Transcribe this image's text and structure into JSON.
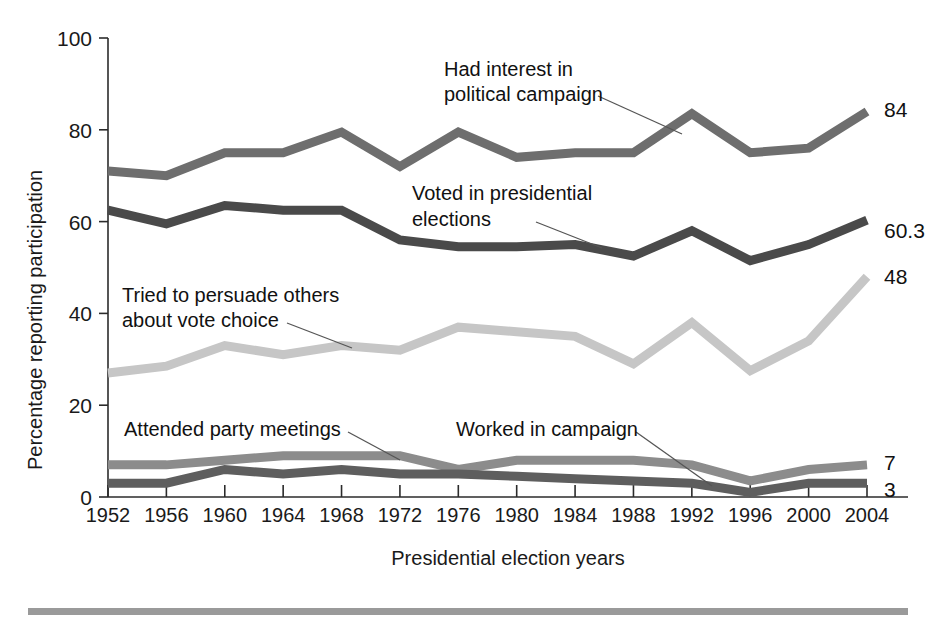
{
  "axes": {
    "ylabel": "Percentage reporting participation",
    "xlabel": "Presidential election years",
    "yticks": [
      "0",
      "20",
      "40",
      "60",
      "80",
      "100"
    ],
    "ylim": [
      0,
      100
    ],
    "xticks": [
      "1952",
      "1956",
      "1960",
      "1964",
      "1968",
      "1972",
      "1976",
      "1980",
      "1984",
      "1988",
      "1992",
      "1996",
      "2000",
      "2004"
    ]
  },
  "annotations": {
    "interest_line1": "Had interest in",
    "interest_line2": "political campaign",
    "voted_line1": "Voted in presidential",
    "voted_line2": "elections",
    "persuade_line1": "Tried to persuade others",
    "persuade_line2": "about vote choice",
    "meetings": "Attended party meetings",
    "worked": "Worked in campaign"
  },
  "end_labels": {
    "interest": "84",
    "voted": "60.3",
    "persuade": "48",
    "meetings": "7",
    "worked": "3"
  },
  "colors": {
    "interest": "#6e6e6e",
    "voted": "#4a4a4a",
    "persuade": "#c6c6c6",
    "meetings": "#8c8c8c",
    "worked": "#5e5e5e",
    "axis": "#2b2b2b",
    "text": "#1a1a1a",
    "footer_rule": "#9a9a9a"
  },
  "chart_data": {
    "type": "line",
    "title": "",
    "xlabel": "Presidential election years",
    "ylabel": "Percentage reporting participation",
    "ylim": [
      0,
      100
    ],
    "grid": false,
    "legend": "inline-annotations",
    "categories": [
      "1952",
      "1956",
      "1960",
      "1964",
      "1968",
      "1972",
      "1976",
      "1980",
      "1984",
      "1988",
      "1992",
      "1996",
      "2000",
      "2004"
    ],
    "series": [
      {
        "name": "Had interest in political campaign",
        "color": "#6e6e6e",
        "end_value": 84,
        "values": [
          71,
          70,
          75,
          75,
          79.5,
          72,
          79.5,
          74,
          75,
          75,
          83.5,
          75,
          76,
          84
        ]
      },
      {
        "name": "Voted in presidential elections",
        "color": "#4a4a4a",
        "end_value": 60.3,
        "values": [
          62.5,
          59.5,
          63.5,
          62.5,
          62.5,
          56,
          54.5,
          54.5,
          55,
          52.5,
          58,
          51.5,
          55,
          60.3
        ]
      },
      {
        "name": "Tried to persuade others about vote choice",
        "color": "#c6c6c6",
        "end_value": 48,
        "values": [
          27,
          28.5,
          33,
          31,
          33,
          32,
          37,
          36,
          35,
          29,
          38,
          27.5,
          34,
          48
        ]
      },
      {
        "name": "Attended party meetings",
        "color": "#8c8c8c",
        "end_value": 7,
        "values": [
          7,
          7,
          8,
          9,
          9,
          9,
          6,
          8,
          8,
          8,
          7,
          3.5,
          6,
          7
        ]
      },
      {
        "name": "Worked in campaign",
        "color": "#5e5e5e",
        "end_value": 3,
        "values": [
          3,
          3,
          6,
          5,
          6,
          5,
          5,
          4.5,
          4,
          3.5,
          3,
          1,
          3,
          3
        ]
      }
    ]
  }
}
